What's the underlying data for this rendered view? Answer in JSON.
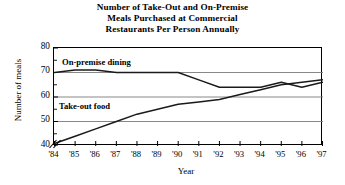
{
  "chart_data": {
    "type": "line",
    "title": "Number of Take-Out and On-Premise Meals Purchased at Commercial Restaurants Per Person Annually",
    "title_lines": [
      "Number of Take-Out and On-Premise",
      "Meals Purchased at Commercial",
      "Restaurants Per Person Annually"
    ],
    "xlabel": "Year",
    "ylabel": "Number of meals",
    "categories": [
      "'84",
      "'85",
      "'86",
      "'87",
      "'88",
      "'89",
      "'90",
      "'91",
      "'92",
      "'93",
      "'94",
      "'95",
      "'96",
      "'97"
    ],
    "x": [
      1984,
      1985,
      1986,
      1987,
      1988,
      1989,
      1990,
      1991,
      1992,
      1993,
      1994,
      1995,
      1996,
      1997
    ],
    "ylim": [
      40,
      80
    ],
    "xlim": [
      1984,
      1997
    ],
    "yticks": [
      40,
      50,
      60,
      70,
      80
    ],
    "ytick_labels": [
      "40",
      "50",
      "60",
      "70",
      "80"
    ],
    "grid": "horizontal",
    "legend": "inline-labels",
    "y_axis_break": true,
    "series": [
      {
        "name": "On-premise dining",
        "label": "On-premise dining",
        "color": "#1a1a1a",
        "values": [
          70,
          71,
          71,
          70,
          70,
          70,
          70,
          67,
          64,
          64,
          64,
          66,
          64,
          66
        ]
      },
      {
        "name": "Take-out food",
        "label": "Take-out food",
        "color": "#1a1a1a",
        "values": [
          41,
          44,
          47,
          50,
          53,
          55,
          57,
          58,
          59,
          61,
          63,
          65,
          66,
          67
        ]
      }
    ],
    "annotations": [
      {
        "text": "On-premise dining",
        "series": "On-premise dining"
      },
      {
        "text": "Take-out food",
        "series": "Take-out food"
      }
    ]
  },
  "style": {
    "grid_color": "#7a7a7a",
    "axis_color": "#000000",
    "line_color": "#1a1a1a",
    "background": "#ffffff"
  }
}
